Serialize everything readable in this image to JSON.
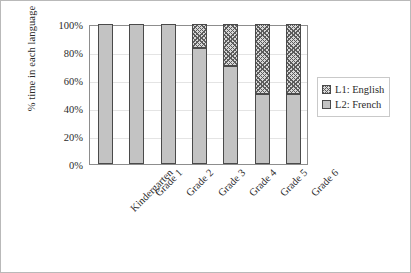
{
  "chart_data": {
    "type": "bar",
    "subtype": "stacked-100-percent",
    "title": "",
    "xlabel": "",
    "ylabel": "% time in each language",
    "categories": [
      "Kindergarten",
      "Grade 1",
      "Grade 2",
      "Grade 3",
      "Grade 4",
      "Grade 5",
      "Grade 6"
    ],
    "series": [
      {
        "name": "L1: English",
        "key": "l1",
        "values": [
          0,
          0,
          0,
          17,
          30,
          50,
          50
        ],
        "fill": "crosshatch",
        "color": "#d8d8d8"
      },
      {
        "name": "L2: French",
        "key": "l2",
        "values": [
          100,
          100,
          100,
          83,
          70,
          50,
          50
        ],
        "fill": "solid",
        "color": "#c3c3c3"
      }
    ],
    "stack_order": [
      "l2",
      "l1"
    ],
    "ylim": [
      0,
      100
    ],
    "yticks": [
      0,
      20,
      40,
      60,
      80,
      100
    ],
    "ytick_labels": [
      "0%",
      "20%",
      "40%",
      "60%",
      "80%",
      "100%"
    ],
    "grid": true,
    "grid_axis": "y",
    "legend_position": "right",
    "legend_entries": [
      "L1: English",
      "L2: French"
    ],
    "x_tick_rotation": -45
  },
  "colors": {
    "figure_border": "#b9b9b9",
    "plot_border": "#8d8d8d",
    "gridline": "#e4e4e4",
    "bar_outline": "#4a4a4a",
    "l2_french": "#c3c3c3",
    "l1_english": "#d8d8d8",
    "text": "#2b2b2b",
    "background": "#ffffff"
  }
}
